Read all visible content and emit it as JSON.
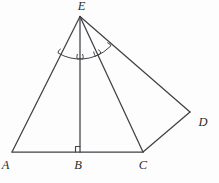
{
  "figure": {
    "type": "geometry-diagram",
    "labels": {
      "E": "E",
      "A": "A",
      "B": "B",
      "C": "C",
      "D": "D"
    },
    "colors": {
      "background": "#fdfdfd",
      "line": "#3f4145",
      "label": "#2b2b2b"
    },
    "marks": {
      "right_angle_at": "B",
      "angle_arcs_vertex": "E",
      "angle_arcs": [
        "AEB",
        "BEC",
        "CED"
      ]
    },
    "segments": [
      "EA",
      "EB",
      "EC",
      "ED",
      "AC",
      "CD"
    ]
  }
}
